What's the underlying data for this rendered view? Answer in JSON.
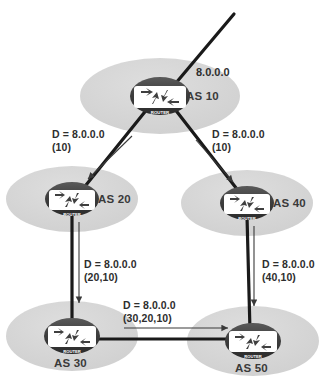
{
  "diagram": {
    "type": "network-topology",
    "colors": {
      "background": "#ffffff",
      "cloud_fill": "#d6d6d6",
      "cloud_fill_dark": "#cccccc",
      "router_body": "#3f3f3f",
      "router_top": "#555555",
      "router_glyph": "#ffffff",
      "link_line": "#1a1a1a",
      "annotation_arrow": "#444444",
      "text": "#2e2e2e"
    },
    "origin_network": "8.0.0.0",
    "nodes": [
      {
        "id": "as10",
        "label": "AS 10",
        "router_caption": "ROUTER",
        "cx": 160,
        "cy": 96,
        "cloud_rx": 80,
        "cloud_ry": 38,
        "label_x": 186,
        "label_y": 90
      },
      {
        "id": "as20",
        "label": "AS 20",
        "router_caption": "ROUTER",
        "cx": 72,
        "cy": 199,
        "cloud_rx": 66,
        "cloud_ry": 33,
        "label_x": 98,
        "label_y": 193
      },
      {
        "id": "as40",
        "label": "AS 40",
        "router_caption": "ROUTER",
        "cx": 247,
        "cy": 203,
        "cloud_rx": 66,
        "cloud_ry": 33,
        "label_x": 273,
        "label_y": 197
      },
      {
        "id": "as30",
        "label": "AS 30",
        "router_caption": "ROUTER",
        "cx": 72,
        "cy": 336,
        "cloud_rx": 66,
        "cloud_ry": 35,
        "label_x": 54,
        "label_y": 357
      },
      {
        "id": "as50",
        "label": "AS 50",
        "router_caption": "ROUTER",
        "cx": 253,
        "cy": 341,
        "cloud_rx": 66,
        "cloud_ry": 35,
        "label_x": 235,
        "label_y": 362
      }
    ],
    "labels": {
      "origin": {
        "text": "8.0.0.0",
        "x": 196,
        "y": 66
      },
      "ann_left_top": {
        "line1": "D = 8.0.0.0",
        "line2": "(10)",
        "x": 52,
        "y": 128
      },
      "ann_right_top": {
        "line1": "D = 8.0.0.0",
        "line2": "(10)",
        "x": 212,
        "y": 128
      },
      "ann_left_mid": {
        "line1": "D = 8.0.0.0",
        "line2": "(20,10)",
        "x": 84,
        "y": 258
      },
      "ann_right_mid": {
        "line1": "D = 8.0.0.0",
        "line2": "(40,10)",
        "x": 262,
        "y": 258
      },
      "ann_bottom": {
        "line1": "D = 8.0.0.0",
        "line2": "(30,20,10)",
        "x": 123,
        "y": 299
      }
    },
    "links": [
      {
        "id": "uplink-to-as10",
        "from": "external",
        "to": "as10",
        "x1": 234,
        "y1": 14,
        "x2": 170,
        "y2": 90
      },
      {
        "id": "as10-to-as20",
        "from": "as10",
        "to": "as20",
        "x1": 148,
        "y1": 108,
        "x2": 82,
        "y2": 190
      },
      {
        "id": "as10-to-as40",
        "from": "as10",
        "to": "as40",
        "x1": 174,
        "y1": 108,
        "x2": 240,
        "y2": 193
      },
      {
        "id": "as20-to-as30",
        "from": "as20",
        "to": "as30",
        "x1": 72,
        "y1": 212,
        "x2": 72,
        "y2": 327
      },
      {
        "id": "as40-to-as50",
        "from": "as40",
        "to": "as50",
        "x1": 247,
        "y1": 216,
        "x2": 250,
        "y2": 331
      },
      {
        "id": "as30-to-as50",
        "from": "as30",
        "to": "as50",
        "x1": 86,
        "y1": 339,
        "x2": 240,
        "y2": 339
      }
    ],
    "update_arrows": [
      {
        "id": "update-as10-as20",
        "x1": 132,
        "y1": 136,
        "x2": 86,
        "y2": 181
      },
      {
        "id": "update-as10-as40",
        "x1": 196,
        "y1": 140,
        "x2": 234,
        "y2": 184
      },
      {
        "id": "update-as20-as30",
        "x1": 79,
        "y1": 222,
        "x2": 79,
        "y2": 305
      },
      {
        "id": "update-as40-as50",
        "x1": 254,
        "y1": 226,
        "x2": 254,
        "y2": 308
      },
      {
        "id": "update-as30-as50",
        "x1": 124,
        "y1": 328,
        "x2": 230,
        "y2": 328
      }
    ]
  }
}
